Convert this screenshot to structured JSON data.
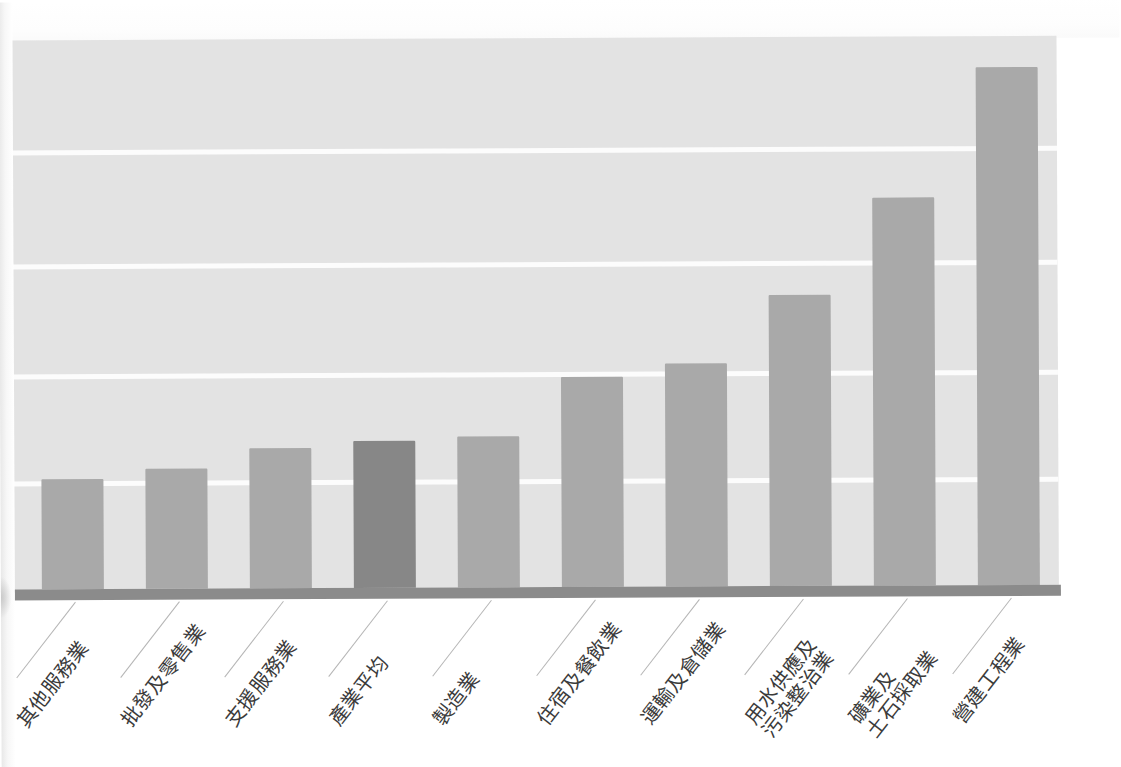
{
  "chart_data": {
    "type": "bar",
    "title": "",
    "subtitle": "",
    "xlabel": "",
    "ylabel": "",
    "legend": [],
    "grid": true,
    "gridline_count": 4,
    "orientation": "vertical",
    "sorted": "ascending",
    "highlight_category": "產業平均",
    "axis_tick_labels": [],
    "categories": [
      "其他服務業",
      "批發及零售業",
      "支援服務業",
      "產業平均",
      "製造業",
      "住宿及餐飲業",
      "運輸及倉儲業",
      "用水供應及污染整治業",
      "礦業及土石採取業",
      "營建工程業"
    ],
    "category_lines": [
      [
        "其他服務業"
      ],
      [
        "批發及零售業"
      ],
      [
        "支援服務業"
      ],
      [
        "產業平均"
      ],
      [
        "製造業"
      ],
      [
        "住宿及餐飲業"
      ],
      [
        "運輸及倉儲業"
      ],
      [
        "用水供應及",
        "污染整治業"
      ],
      [
        "礦業及",
        "土石採取業"
      ],
      [
        "營建工程業"
      ]
    ],
    "values": [
      110,
      120,
      140,
      147,
      151,
      210,
      223,
      291,
      388,
      518
    ],
    "value_unit": "px-height (no axis labels shown)",
    "ylim": [
      0,
      549
    ],
    "bar_pixel_tops": [
      477,
      467,
      447,
      440,
      436,
      377,
      364,
      296,
      199,
      69
    ],
    "bar_left_positions": [
      33,
      137,
      241,
      345,
      449,
      553,
      657,
      761,
      865,
      969
    ],
    "bar_width": 62,
    "bar_pitch": 104,
    "gridline_y": [
      110,
      224,
      334,
      441
    ],
    "colors": {
      "bar": "#a9a9a9",
      "bar_highlight": "#878787",
      "plot_background": "#e3e3e3",
      "gridline": "#fcfcfc",
      "axis": "#8b8b8b",
      "label_text": "#3b3b3b",
      "leader_line": "#b5b5b5",
      "page_background": "#ffffff"
    }
  }
}
